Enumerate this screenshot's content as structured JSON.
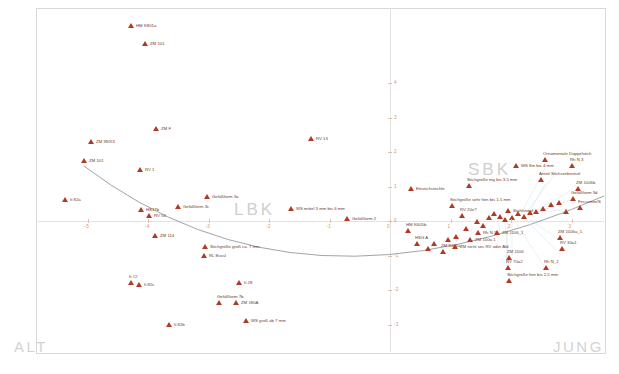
{
  "figure": {
    "type": "correspondence-analysis-scatter",
    "regions": [
      {
        "name": "region-alt",
        "text": "ALT",
        "x": 14,
        "y": 338,
        "style": "corner"
      },
      {
        "name": "region-jung",
        "text": "JUNG",
        "x": 553,
        "y": 338,
        "style": "corner"
      },
      {
        "name": "region-lbk",
        "text": "LBK",
        "x": 234,
        "y": 200,
        "style": "big"
      },
      {
        "name": "region-sbk",
        "text": "SBK",
        "x": 468,
        "y": 160,
        "style": "big"
      }
    ]
  },
  "chart_data": {
    "type": "scatter",
    "title": "",
    "xlabel": "",
    "ylabel": "",
    "xlim": [
      -5,
      4
    ],
    "ylim": [
      -4,
      5
    ],
    "grid": false,
    "legend": "none",
    "axis_origin_px": {
      "x": 390,
      "y": 221
    },
    "px_per_unit": {
      "x": 60.5,
      "y": 34.5
    },
    "x_ticks": [
      "-5",
      "-4",
      "-3",
      "-2",
      "-1",
      "0",
      "1",
      "2",
      "3"
    ],
    "y_ticks": [
      "4",
      "3",
      "2",
      "1",
      "0",
      "-1",
      "-2",
      "-3",
      "-4"
    ],
    "marker": "triangle",
    "marker_color": "#b23a24",
    "trend": {
      "shape": "parabola",
      "description": "horseshoe / Guttman-effect arch through the point cloud",
      "color": "#7b7b7b"
    },
    "points": [
      {
        "label": "HM K801a",
        "px": 131,
        "py": 26,
        "pos": "right"
      },
      {
        "label": "ZM 101",
        "px": 145,
        "py": 44,
        "pos": "right"
      },
      {
        "label": "ZM F",
        "px": 156,
        "py": 129,
        "pos": "right"
      },
      {
        "label": "ZM 99/XX",
        "px": 91,
        "py": 142,
        "pos": "right"
      },
      {
        "label": "ZM 101",
        "px": 84,
        "py": 161,
        "pos": "right"
      },
      {
        "label": "RV 1",
        "px": 140,
        "py": 170,
        "pos": "right"
      },
      {
        "label": "RV 13",
        "px": 311,
        "py": 139,
        "pos": "right"
      },
      {
        "label": "Gefäßform 3a",
        "px": 207,
        "py": 197,
        "pos": "right"
      },
      {
        "label": "It 82a",
        "px": 65,
        "py": 200,
        "pos": "right"
      },
      {
        "label": "HS17b",
        "px": 141,
        "py": 210,
        "pos": "right"
      },
      {
        "label": "Gefäßform 3c",
        "px": 178,
        "py": 207,
        "pos": "right"
      },
      {
        "label": "RV 56",
        "px": 149,
        "py": 216,
        "pos": "right"
      },
      {
        "label": "ZM 114",
        "px": 155,
        "py": 236,
        "pos": "right"
      },
      {
        "label": "WS mittel 3 mm bis 6 mm",
        "px": 291,
        "py": 209,
        "pos": "right"
      },
      {
        "label": "Gefäßform 2",
        "px": 347,
        "py": 219,
        "pos": "right"
      },
      {
        "label": "Stichgröße groß ca. 7 mm",
        "px": 205,
        "py": 247,
        "pos": "right"
      },
      {
        "label": "RL Bussl",
        "px": 204,
        "py": 256,
        "pos": "right"
      },
      {
        "label": "It #2",
        "px": 131,
        "py": 283,
        "pos": "above"
      },
      {
        "label": "It 82c",
        "px": 139,
        "py": 285,
        "pos": "right"
      },
      {
        "label": "It 28",
        "px": 239,
        "py": 283,
        "pos": "right"
      },
      {
        "label": "Gefäßform 7b",
        "px": 219,
        "py": 303,
        "pos": "above"
      },
      {
        "label": "ZM 180A",
        "px": 236,
        "py": 303,
        "pos": "right"
      },
      {
        "label": "It 82b",
        "px": 169,
        "py": 325,
        "pos": "right"
      },
      {
        "label": "WS groß ab 7 mm",
        "px": 246,
        "py": 321,
        "pos": "right"
      },
      {
        "label": "Einstichstechle",
        "px": 411,
        "py": 189,
        "pos": "right"
      },
      {
        "label": "Stichgröße mg bis 3,5 mm",
        "px": 469,
        "py": 186,
        "pos": "above"
      },
      {
        "label": "Stichgröße sehr fein bis 1,5 mm",
        "px": 452,
        "py": 206,
        "pos": "above"
      },
      {
        "label": "RV 20a?",
        "px": 462,
        "py": 216,
        "pos": "above"
      },
      {
        "label": "HM K605b",
        "px": 408,
        "py": 231,
        "pos": "above"
      },
      {
        "label": "HSG A",
        "px": 417,
        "py": 244,
        "pos": "above"
      },
      {
        "label": "ZM K405a",
        "px": 443,
        "py": 252,
        "pos": "above"
      },
      {
        "label": "ZM nicht sec RV oder Ald",
        "px": 455,
        "py": 247,
        "pos": "right"
      },
      {
        "label": "ZM 100a 1",
        "px": 470,
        "py": 240,
        "pos": "right"
      },
      {
        "label": "Rh N 1",
        "px": 478,
        "py": 233,
        "pos": "right"
      },
      {
        "label": "ZM 1106_1",
        "px": 497,
        "py": 233,
        "pos": "right"
      },
      {
        "label": "Stahlstreul",
        "px": 508,
        "py": 211,
        "pos": "right"
      },
      {
        "label": "WS 8m bis 4 mm",
        "px": 516,
        "py": 166,
        "pos": "right"
      },
      {
        "label": "Ornamentale Doppelstich",
        "px": 545,
        "py": 160,
        "pos": "above"
      },
      {
        "label": "Rh N 3",
        "px": 572,
        "py": 166,
        "pos": "above"
      },
      {
        "label": "Anteil Stichverbreitsel",
        "px": 541,
        "py": 180,
        "pos": "above"
      },
      {
        "label": "ZM 1006b",
        "px": 578,
        "py": 189,
        "pos": "above"
      },
      {
        "label": "Gefäßform 3d",
        "px": 573,
        "py": 199,
        "pos": "above"
      },
      {
        "label": "Feccomm/S",
        "px": 580,
        "py": 208,
        "pos": "above"
      },
      {
        "label": "ZM 1006a_1",
        "px": 560,
        "py": 238,
        "pos": "above"
      },
      {
        "label": "RV 30a1",
        "px": 562,
        "py": 249,
        "pos": "above"
      },
      {
        "label": "ZM 1106",
        "px": 509,
        "py": 258,
        "pos": "above"
      },
      {
        "label": "RV 70a2",
        "px": 508,
        "py": 268,
        "pos": "above"
      },
      {
        "label": "Rh N_2",
        "px": 546,
        "py": 268,
        "pos": "above"
      },
      {
        "label": "Stichgröße fein bis 2,5 mm",
        "px": 509,
        "py": 281,
        "pos": "above"
      },
      {
        "label": "",
        "px": 489,
        "py": 218,
        "pos": "none"
      },
      {
        "label": "",
        "px": 494,
        "py": 214,
        "pos": "none"
      },
      {
        "label": "",
        "px": 500,
        "py": 217,
        "pos": "none"
      },
      {
        "label": "",
        "px": 505,
        "py": 220,
        "pos": "none"
      },
      {
        "label": "",
        "px": 512,
        "py": 218,
        "pos": "none"
      },
      {
        "label": "",
        "px": 518,
        "py": 214,
        "pos": "none"
      },
      {
        "label": "",
        "px": 524,
        "py": 217,
        "pos": "none"
      },
      {
        "label": "",
        "px": 530,
        "py": 213,
        "pos": "none"
      },
      {
        "label": "",
        "px": 536,
        "py": 212,
        "pos": "none"
      },
      {
        "label": "",
        "px": 543,
        "py": 209,
        "pos": "none"
      },
      {
        "label": "",
        "px": 477,
        "py": 222,
        "pos": "none"
      },
      {
        "label": "",
        "px": 483,
        "py": 226,
        "pos": "none"
      },
      {
        "label": "",
        "px": 466,
        "py": 229,
        "pos": "none"
      },
      {
        "label": "",
        "px": 456,
        "py": 237,
        "pos": "none"
      },
      {
        "label": "",
        "px": 448,
        "py": 240,
        "pos": "none"
      },
      {
        "label": "",
        "px": 434,
        "py": 244,
        "pos": "none"
      },
      {
        "label": "",
        "px": 428,
        "py": 249,
        "pos": "none"
      },
      {
        "label": "",
        "px": 551,
        "py": 205,
        "pos": "none"
      },
      {
        "label": "",
        "px": 559,
        "py": 203,
        "pos": "none"
      },
      {
        "label": "",
        "px": 566,
        "py": 212,
        "pos": "none"
      }
    ]
  }
}
